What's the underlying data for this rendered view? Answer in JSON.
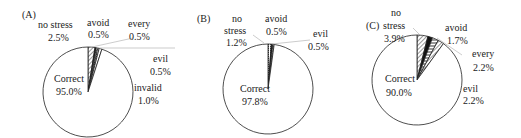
{
  "chart_data": [
    {
      "type": "pie",
      "title": "(A)",
      "slices": [
        {
          "label": "no stress",
          "value": 2.5,
          "pattern": "diagonal-hatch"
        },
        {
          "label": "avoid",
          "value": 0.5,
          "pattern": "solid-dark"
        },
        {
          "label": "every",
          "value": 0.5,
          "pattern": "dense-hatch"
        },
        {
          "label": "evil",
          "value": 0.5,
          "pattern": "dots"
        },
        {
          "label": "invalid",
          "value": 1.0,
          "pattern": "white"
        },
        {
          "label": "Correct",
          "value": 95.0,
          "pattern": "white"
        }
      ]
    },
    {
      "type": "pie",
      "title": "(B)",
      "slices": [
        {
          "label": "no stress",
          "value": 1.2,
          "pattern": "dots"
        },
        {
          "label": "avoid",
          "value": 0.5,
          "pattern": "solid-dark"
        },
        {
          "label": "evil",
          "value": 0.5,
          "pattern": "dense-hatch"
        },
        {
          "label": "Correct",
          "value": 97.8,
          "pattern": "white"
        }
      ]
    },
    {
      "type": "pie",
      "title": "(C)",
      "slices": [
        {
          "label": "no stress",
          "value": 3.9,
          "pattern": "diagonal-hatch"
        },
        {
          "label": "avoid",
          "value": 1.7,
          "pattern": "solid-dark"
        },
        {
          "label": "every",
          "value": 2.2,
          "pattern": "horizontal-hatch"
        },
        {
          "label": "evil",
          "value": 2.2,
          "pattern": "diagonal-hatch"
        },
        {
          "label": "Correct",
          "value": 90.0,
          "pattern": "white"
        }
      ]
    }
  ],
  "labels": {
    "A": {
      "title": "(A)",
      "no_stress_1": "no stress",
      "no_stress_v": "2.5%",
      "avoid": "avoid",
      "avoid_v": "0.5%",
      "every": "every",
      "every_v": "0.5%",
      "evil": "evil",
      "evil_v": "0.5%",
      "invalid": "invalid",
      "invalid_v": "1.0%",
      "correct": "Correct",
      "correct_v": "95.0%"
    },
    "B": {
      "title": "(B)",
      "no": "no",
      "stress": "stress",
      "no_stress_v": "1.2%",
      "avoid": "avoid",
      "avoid_v": "0.5%",
      "evil": "evil",
      "evil_v": "0.5%",
      "correct": "Correct",
      "correct_v": "97.8%"
    },
    "C": {
      "title": "(C)",
      "no": "no",
      "stress": "stress",
      "no_stress_v": "3.9%",
      "avoid": "avoid",
      "avoid_v": "1.7%",
      "every": "every",
      "every_v": "2.2%",
      "evil": "evil",
      "evil_v": "2.2%",
      "correct": "Correct",
      "correct_v": "90.0%"
    }
  }
}
